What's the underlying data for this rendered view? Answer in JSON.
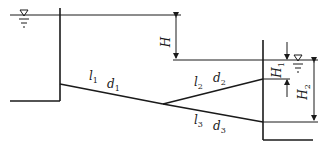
{
  "diagram": {
    "type": "branched pipe flow between reservoirs",
    "labels": {
      "H": {
        "main": "H",
        "sub": ""
      },
      "H1": {
        "main": "H",
        "sub": "1"
      },
      "H2": {
        "main": "H",
        "sub": "2"
      },
      "l1": {
        "main": "l",
        "sub": "1"
      },
      "d1": {
        "main": "d",
        "sub": "1"
      },
      "l2": {
        "main": "l",
        "sub": "2"
      },
      "d2": {
        "main": "d",
        "sub": "2"
      },
      "l3": {
        "main": "l",
        "sub": "3"
      },
      "d3": {
        "main": "d",
        "sub": "3"
      }
    },
    "symbols": {
      "water_surface": "▽"
    },
    "colors": {
      "line": "#1a1a1a",
      "background": "#ffffff"
    }
  }
}
